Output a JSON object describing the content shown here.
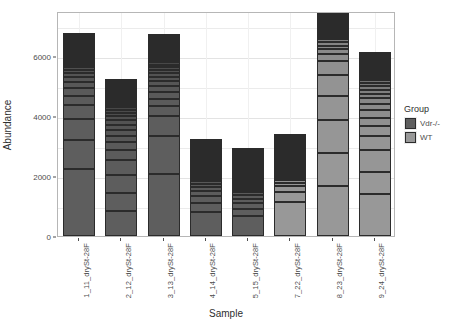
{
  "chart_data": {
    "type": "bar",
    "subtype": "stacked-bar",
    "title": "",
    "xlabel": "Sample",
    "ylabel": "Abundance",
    "ylim": [
      0,
      7500
    ],
    "yticks": [
      0,
      2000,
      4000,
      6000
    ],
    "ytick_labels": [
      "0",
      "2000",
      "4000",
      "6000"
    ],
    "grid": true,
    "legend": {
      "title": "Group",
      "position": "right",
      "entries": [
        {
          "label": "Vdr-/-",
          "color": "#5e5e5e"
        },
        {
          "label": "WT",
          "color": "#989898"
        }
      ]
    },
    "categories": [
      "1_11_drySt-28F",
      "2_12_drySt-28F",
      "3_13_drySt-28F",
      "4_14_drySt-28F",
      "5_15_drySt-28F",
      "7_22_drySt-28F",
      "8_23_drySt-28F",
      "9_24_drySt-28F"
    ],
    "group_of_category": [
      "Vdr-/-",
      "Vdr-/-",
      "Vdr-/-",
      "Vdr-/-",
      "Vdr-/-",
      "WT",
      "WT",
      "WT"
    ],
    "totals": [
      6150,
      5050,
      6000,
      2300,
      1820,
      2150,
      7150,
      5450
    ],
    "stacks": [
      [
        2250,
        940,
        700,
        470,
        300,
        260,
        210,
        160,
        130,
        110,
        95,
        85,
        75,
        65,
        60,
        50,
        45,
        40,
        35,
        30,
        25,
        22,
        20,
        18,
        15,
        12,
        10,
        8
      ],
      [
        830,
        600,
        620,
        480,
        330,
        260,
        220,
        200,
        170,
        150,
        130,
        115,
        100,
        90,
        80,
        70,
        60,
        52,
        45,
        38,
        32,
        28,
        24,
        20,
        16,
        12,
        10,
        8
      ],
      [
        2080,
        1250,
        660,
        330,
        260,
        220,
        190,
        165,
        145,
        125,
        110,
        95,
        85,
        75,
        65,
        55,
        48,
        42,
        36,
        30,
        26,
        22,
        18,
        15,
        12,
        10,
        8,
        6
      ],
      [
        800,
        290,
        240,
        180,
        130,
        105,
        90,
        78,
        68,
        60,
        52,
        45,
        38,
        33,
        28,
        24,
        20,
        17,
        15,
        13,
        11,
        9,
        8,
        7,
        6,
        5,
        4,
        4
      ],
      [
        670,
        240,
        190,
        150,
        115,
        95,
        82,
        70,
        60,
        52,
        45,
        38,
        32,
        28,
        24,
        20,
        17,
        15,
        13,
        11,
        9,
        8,
        7,
        6,
        5,
        4,
        4,
        3
      ],
      [
        1150,
        330,
        180,
        110,
        85,
        70,
        60,
        52,
        45,
        38,
        32,
        28,
        24,
        20,
        17,
        15,
        13,
        11,
        9,
        8,
        7,
        6,
        5,
        5,
        4,
        4,
        3,
        3
      ],
      [
        1670,
        1100,
        1110,
        780,
        720,
        470,
        210,
        160,
        130,
        110,
        95,
        85,
        75,
        65,
        58,
        50,
        44,
        38,
        33,
        28,
        24,
        20,
        17,
        15,
        12,
        10,
        8,
        7
      ],
      [
        1390,
        730,
        760,
        450,
        330,
        290,
        250,
        210,
        180,
        155,
        135,
        118,
        102,
        88,
        76,
        66,
        56,
        48,
        41,
        35,
        30,
        26,
        22,
        18,
        15,
        12,
        10,
        8
      ]
    ]
  },
  "colors": {
    "vdr": "#5e5e5e",
    "wt": "#989898",
    "panel_bg": "#ffffff",
    "grid": "#ebebeb",
    "border": "#b6b6b6",
    "segment_border": "#2b2b2b",
    "text": "#4d4d4d"
  }
}
